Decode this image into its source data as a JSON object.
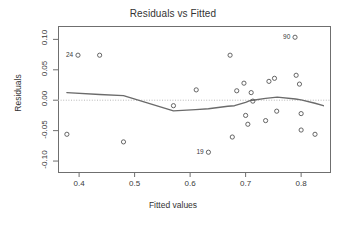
{
  "chart_data": {
    "type": "scatter",
    "title": "Residuals vs Fitted",
    "xlabel": "Fitted values",
    "ylabel": "Residuals",
    "xlim": [
      0.362,
      0.852
    ],
    "ylim": [
      -0.118,
      0.122
    ],
    "xticks": [
      0.4,
      0.5,
      0.6,
      0.7,
      0.8
    ],
    "xtick_labels": [
      "0.4",
      "0.5",
      "0.6",
      "0.7",
      "0.8"
    ],
    "yticks": [
      0.1,
      0.05,
      0.0,
      -0.05,
      -0.1
    ],
    "ytick_labels": [
      "0.10",
      "0.05",
      "0.00",
      "-0.05",
      "-0.10"
    ],
    "grid": false,
    "legend": "none",
    "reference_line": {
      "y": 0.0,
      "style": "dotted",
      "color": "#b8b8b8"
    },
    "smoother": {
      "name": "lowess",
      "color": "#6b6b6b",
      "x": [
        0.378,
        0.437,
        0.48,
        0.57,
        0.61,
        0.633,
        0.668,
        0.68,
        0.7,
        0.71,
        0.713,
        0.736,
        0.757,
        0.79,
        0.8,
        0.825,
        0.84
      ],
      "y": [
        0.0125,
        0.0095,
        0.0075,
        -0.0175,
        -0.0155,
        -0.014,
        -0.01,
        -0.009,
        -0.0035,
        0.0,
        0.0,
        0.003,
        0.005,
        0.002,
        0.0005,
        -0.005,
        -0.009
      ]
    },
    "points": [
      {
        "x": 0.398,
        "y": 0.074,
        "label": "24",
        "label_side": "left"
      },
      {
        "x": 0.437,
        "y": 0.074,
        "label": null
      },
      {
        "x": 0.378,
        "y": -0.056,
        "label": null
      },
      {
        "x": 0.48,
        "y": -0.0685,
        "label": null
      },
      {
        "x": 0.57,
        "y": -0.009,
        "label": null
      },
      {
        "x": 0.611,
        "y": 0.017,
        "label": null
      },
      {
        "x": 0.633,
        "y": -0.0855,
        "label": "19",
        "label_side": "left"
      },
      {
        "x": 0.672,
        "y": 0.074,
        "label": null
      },
      {
        "x": 0.676,
        "y": -0.0605,
        "label": null
      },
      {
        "x": 0.684,
        "y": 0.0155,
        "label": null
      },
      {
        "x": 0.697,
        "y": 0.028,
        "label": null
      },
      {
        "x": 0.7,
        "y": -0.025,
        "label": null
      },
      {
        "x": 0.704,
        "y": -0.0395,
        "label": null
      },
      {
        "x": 0.71,
        "y": 0.0125,
        "label": null
      },
      {
        "x": 0.713,
        "y": -0.0015,
        "label": null
      },
      {
        "x": 0.736,
        "y": -0.0335,
        "label": null
      },
      {
        "x": 0.742,
        "y": 0.031,
        "label": null
      },
      {
        "x": 0.752,
        "y": 0.036,
        "label": null
      },
      {
        "x": 0.756,
        "y": -0.018,
        "label": null
      },
      {
        "x": 0.789,
        "y": 0.1035,
        "label": "90",
        "label_side": "left"
      },
      {
        "x": 0.791,
        "y": 0.041,
        "label": null
      },
      {
        "x": 0.797,
        "y": 0.0265,
        "label": null
      },
      {
        "x": 0.8,
        "y": -0.022,
        "label": null
      },
      {
        "x": 0.8,
        "y": -0.049,
        "label": null
      },
      {
        "x": 0.825,
        "y": -0.056,
        "label": null
      }
    ]
  }
}
